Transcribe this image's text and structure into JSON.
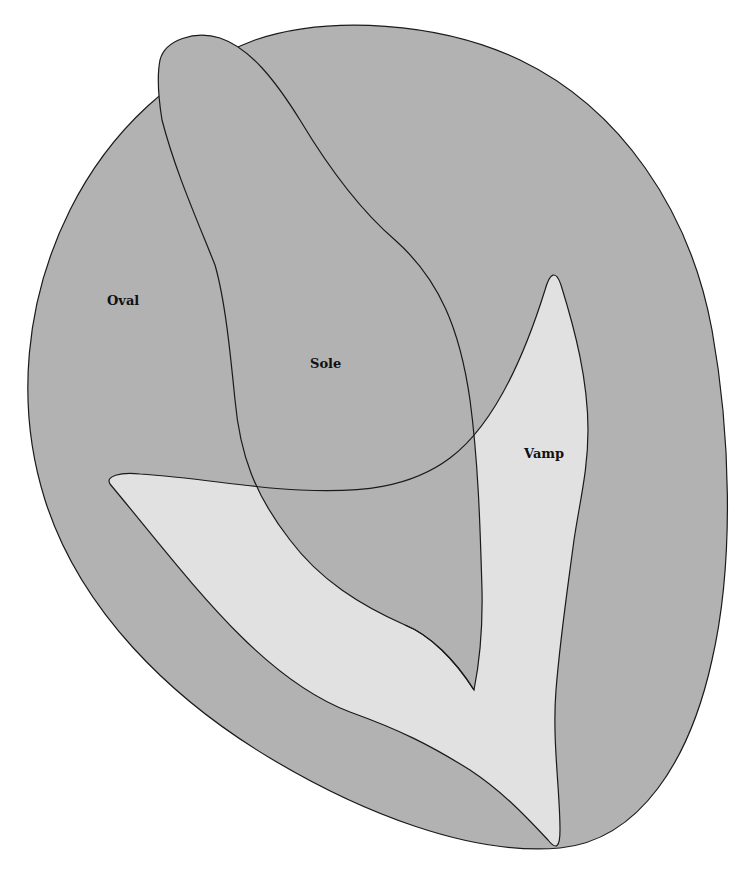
{
  "diagram": {
    "colors": {
      "oval_fill": "#b2b2b2",
      "sole_fill": "#b2b2b2",
      "vamp_fill": "#e1e1e1",
      "stroke": "#1a1a1a",
      "background": "#ffffff"
    },
    "regions": [
      {
        "id": "oval",
        "label": "Oval",
        "x": 107,
        "y": 293
      },
      {
        "id": "sole",
        "label": "Sole",
        "x": 310,
        "y": 356
      },
      {
        "id": "vamp",
        "label": "Vamp",
        "x": 524,
        "y": 446
      }
    ]
  }
}
